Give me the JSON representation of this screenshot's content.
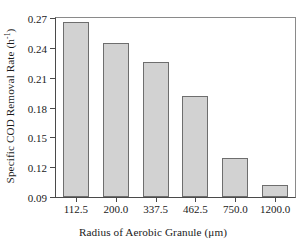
{
  "chart_data": {
    "type": "bar",
    "title": "",
    "xlabel": "Radius of Aerobic Granule (μm)",
    "ylabel": "Specific COD Removal Rate (h⁻¹)",
    "ylabel_text": "Specific COD Removal Rate (h",
    "ylabel_sup": "-1",
    "ylabel_tail": ")",
    "categories": [
      "112.5",
      "200.0",
      "337.5",
      "462.5",
      "750.0",
      "1200.0"
    ],
    "values": [
      0.266,
      0.245,
      0.226,
      0.192,
      0.129,
      0.102
    ],
    "ylim": [
      0.09,
      0.27
    ],
    "yticks": [
      "0.27",
      "0.24",
      "0.21",
      "0.18",
      "0.15",
      "0.12",
      "0.09"
    ],
    "ytick_values": [
      0.27,
      0.24,
      0.21,
      0.18,
      0.15,
      0.12,
      0.09
    ],
    "grid": false,
    "legend": null,
    "bar_color": "#d2d2d2",
    "bar_edge_color": "#6e6e6e",
    "axis_color": "#4a4a4a",
    "background": "#ffffff"
  }
}
